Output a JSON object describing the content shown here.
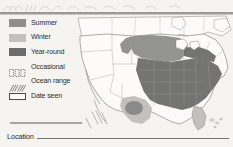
{
  "page": {
    "background_color": "#f5f4f1",
    "top_scribble_present": true
  },
  "legend": {
    "items": [
      {
        "label": "Summer",
        "icon": "filled-square-swatch-icon",
        "style": "solid",
        "color": "#8e8e8c"
      },
      {
        "label": "Winter",
        "icon": "filled-square-swatch-icon",
        "style": "solid",
        "color": "#c2c1bd"
      },
      {
        "label": "Year-round",
        "icon": "filled-square-swatch-icon",
        "style": "solid",
        "color": "#6d6d6b"
      },
      {
        "label": "Occasional",
        "icon": "dotted-square-swatch-icon",
        "style": "dotted",
        "color": "#6f6f6d"
      },
      {
        "label": "Ocean range",
        "icon": "hatched-swatch-icon",
        "style": "hatch",
        "color": "#6f6f6d"
      },
      {
        "label": "Date seen",
        "icon": "outlined-square-swatch-icon",
        "style": "outline",
        "color": "#4a4a48"
      }
    ]
  },
  "map": {
    "name": "north-america-range-map",
    "colors": {
      "land_fill": "#fcfbf9",
      "border": "#8a8986",
      "summer": "#8e8e8c",
      "winter": "#c2c1bd",
      "year_round": "#6d6d6b"
    },
    "regions": [
      {
        "name": "eastern-united-states",
        "shade": "year-round"
      },
      {
        "name": "great-plains-upper-midwest",
        "shade": "summer"
      },
      {
        "name": "texas-gulf-coast",
        "shade": "winter"
      },
      {
        "name": "florida-peninsula",
        "shade": "winter"
      },
      {
        "name": "western-united-states",
        "shade": "none"
      }
    ]
  },
  "footer": {
    "location_label": "Location"
  }
}
